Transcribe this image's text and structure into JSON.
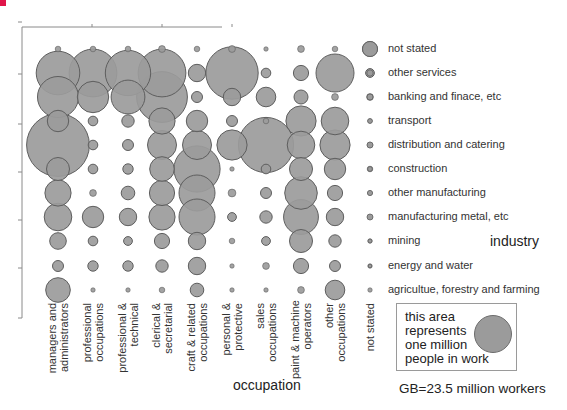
{
  "chart_data": {
    "type": "bubble_matrix",
    "title": "",
    "xlabel": "occupation",
    "ylabel": "industry",
    "categories_x": [
      "managers and administrators",
      "professional occupations",
      "professional & technical",
      "clerical & secretarial",
      "craft & related occupations",
      "personal & protective",
      "sales occupations",
      "paint & machine operators",
      "other occupations",
      "not stated"
    ],
    "categories_y": [
      "not stated",
      "other services",
      "banking and finace, etc",
      "transport",
      "distribution and catering",
      "construction",
      "other manufacturing",
      "manufacturing metal, etc",
      "mining",
      "energy and water",
      "agricultue, forestry and farming"
    ],
    "units": "million people in work (bubble area)",
    "values_millions": [
      [
        0.02,
        0.02,
        0.02,
        0.03,
        0.02,
        0.03,
        0.01,
        0.03,
        0.02,
        0.15
      ],
      [
        1.25,
        1.5,
        1.35,
        1.5,
        0.2,
        1.8,
        0.06,
        0.15,
        0.95,
        0.05
      ],
      [
        1.1,
        0.65,
        0.75,
        1.7,
        0.08,
        0.2,
        0.25,
        0.13,
        0.03,
        0.03
      ],
      [
        0.3,
        0.06,
        0.1,
        0.45,
        0.3,
        0.08,
        0.02,
        0.6,
        0.5,
        0.01
      ],
      [
        2.6,
        0.06,
        0.08,
        0.55,
        0.55,
        0.6,
        2.0,
        0.5,
        0.6,
        0.02
      ],
      [
        0.35,
        0.06,
        0.07,
        0.4,
        1.4,
        0.01,
        0.06,
        0.35,
        0.3,
        0.02
      ],
      [
        0.45,
        0.03,
        0.12,
        0.42,
        0.85,
        0.04,
        0.08,
        0.7,
        0.15,
        0.01
      ],
      [
        0.5,
        0.3,
        0.2,
        0.45,
        0.85,
        0.05,
        0.1,
        0.8,
        0.2,
        0.01
      ],
      [
        0.18,
        0.06,
        0.05,
        0.15,
        0.2,
        0.02,
        0.05,
        0.35,
        0.1,
        0.01
      ],
      [
        0.08,
        0.07,
        0.07,
        0.1,
        0.2,
        0.01,
        0.03,
        0.15,
        0.08,
        0.01
      ],
      [
        0.4,
        0.01,
        0.01,
        0.02,
        0.12,
        0.01,
        0.01,
        0.03,
        0.25,
        0.01
      ]
    ],
    "legend": {
      "text": "this area represents one million people in work",
      "unit_value_millions": 1
    },
    "annotation": "GB=23.5 million workers",
    "grid": false
  },
  "labels": {
    "industry_title": "industry",
    "occupation_title": "occupation",
    "legend_text": "this area\nrepresents\none million\npeople in work",
    "footnote": "GB=23.5 million workers",
    "industries": [
      "not stated",
      "other services",
      "banking and finace, etc",
      "transport",
      "distribution and catering",
      "construction",
      "other manufacturing",
      "manufacturing metal, etc",
      "mining",
      "energy and water",
      "agricultue, forestry and farming"
    ],
    "occupations": [
      "managers and\nadministrators",
      "professional\noccupations",
      "professional &\ntechnical",
      "clerical &\nsecretarial",
      "craft & related\noccupations",
      "personal &\nprotective",
      "sales\noccupations",
      "paint & machine\noperators",
      "other\noccupations",
      "not stated"
    ]
  },
  "style": {
    "bubble_fill": "#9b9b9b",
    "bubble_stroke": "#5e5e5e",
    "axis_color": "#8a8a8a",
    "accent_mark": "#e0154a"
  }
}
